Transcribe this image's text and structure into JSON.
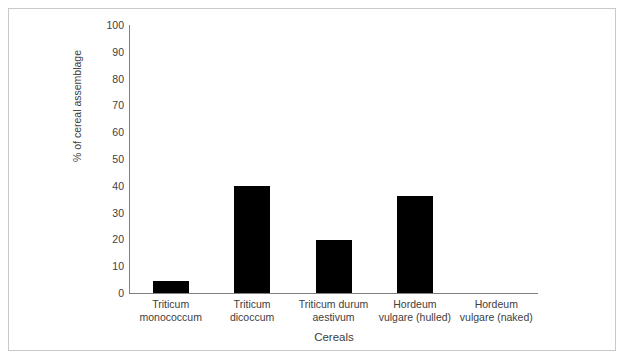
{
  "chart_data": {
    "type": "bar",
    "title": "",
    "xlabel": "Cereals",
    "ylabel": "% of cereal assemblage",
    "categories": [
      "Triticum monococcum",
      "Triticum dicoccum",
      "Triticum durum aestivum",
      "Hordeum vulgare (hulled)",
      "Hordeum vulgare (naked)"
    ],
    "category_lines": [
      [
        "Triticum",
        "monococcum"
      ],
      [
        "Triticum",
        "dicoccum"
      ],
      [
        "Triticum durum",
        "aestivum"
      ],
      [
        "Hordeum",
        "vulgare (hulled)"
      ],
      [
        "Hordeum",
        "vulgare (naked)"
      ]
    ],
    "values": [
      4.5,
      39.9,
      19.8,
      36.2,
      0
    ],
    "ylim": [
      0,
      100
    ],
    "ytick_values": [
      0,
      10,
      20,
      30,
      40,
      50,
      60,
      70,
      80,
      90,
      100
    ],
    "ytick_labels": [
      "0",
      "10",
      "20",
      "30",
      "40",
      "50",
      "60",
      "70",
      "80",
      "90",
      "100"
    ],
    "grid": false,
    "legend": false,
    "bar_color": "#000000",
    "axis_color": "#808080",
    "text_color": "#404040",
    "frame_color": "#c9c9c9",
    "background": "#ffffff"
  }
}
